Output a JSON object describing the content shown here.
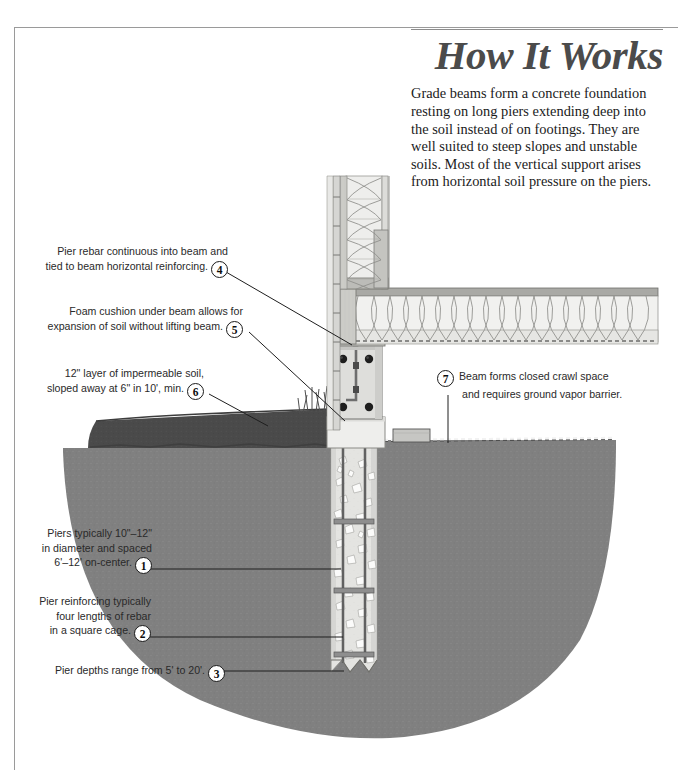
{
  "document": {
    "title": "How It Works",
    "intro": "Grade beams form a concrete foundation resting on long piers extending deep into the soil instead of on footings. They are well suited to steep slopes and unstable soils. Most of the vertical support arises from horizontal soil pressure on the piers.",
    "subject": "Grade beam and drilled pier foundation section"
  },
  "callouts": [
    {
      "number": "1",
      "lines": [
        "Piers typically 10\"–12\"",
        "in diameter and spaced",
        "6'–12' on-center."
      ],
      "side": "left"
    },
    {
      "number": "2",
      "lines": [
        "Pier reinforcing typically",
        "four lengths of rebar",
        "in a square cage."
      ],
      "side": "left"
    },
    {
      "number": "3",
      "lines": [
        "Pier depths range from 5' to 20'."
      ],
      "side": "left"
    },
    {
      "number": "4",
      "lines": [
        "Pier rebar continuous into beam and",
        "tied to beam horizontal reinforcing."
      ],
      "side": "left"
    },
    {
      "number": "5",
      "lines": [
        "Foam cushion under beam allows for",
        "expansion of soil without lifting beam."
      ],
      "side": "left"
    },
    {
      "number": "6",
      "lines": [
        "12\" layer of impermeable soil,",
        "sloped away at 6\" in 10', min."
      ],
      "side": "left"
    },
    {
      "number": "7",
      "lines": [
        "Beam forms closed crawl space",
        "and requires ground vapor barrier."
      ],
      "side": "right"
    }
  ],
  "drawing_elements": [
    {
      "name": "lap-siding",
      "label": "Lap siding"
    },
    {
      "name": "wall-sheathing",
      "label": "Wall sheathing"
    },
    {
      "name": "wall-batt-insulation",
      "label": "Wall batt insulation"
    },
    {
      "name": "rim-joist",
      "label": "Rim joist"
    },
    {
      "name": "floor-joist-insulation",
      "label": "Floor joist insulation"
    },
    {
      "name": "subfloor",
      "label": "Subfloor"
    },
    {
      "name": "grade-beam",
      "label": "Concrete grade beam"
    },
    {
      "name": "beam-horizontal-rebar",
      "label": "Beam horizontal rebar"
    },
    {
      "name": "pier-vertical-rebar",
      "label": "Pier vertical rebar"
    },
    {
      "name": "pier-rebar-tie",
      "label": "Pier rebar tie"
    },
    {
      "name": "foam-cushion",
      "label": "Foam cushion under beam"
    },
    {
      "name": "concrete-pier",
      "label": "Drilled concrete pier"
    },
    {
      "name": "impermeable-soil-layer",
      "label": "Impermeable soil layer"
    },
    {
      "name": "soil-mass",
      "label": "Undisturbed soil"
    },
    {
      "name": "grass",
      "label": "Grass at grade"
    },
    {
      "name": "vapor-barrier",
      "label": "Ground vapor barrier"
    },
    {
      "name": "crawl-space-block",
      "label": "Crawl space blocking"
    },
    {
      "name": "break-line",
      "label": "Pier break line"
    }
  ],
  "colors": {
    "frame": "#9a9a9a",
    "title": "#4b4b4b",
    "text": "#2a2a2a",
    "soil_mass": "#808080",
    "impermeable_soil": "#4a4a4a",
    "concrete": "#e2e2e0",
    "rebar": "#6e6e6e",
    "insulation": "#ececea",
    "framing": "#c9c9c6",
    "aggregate": "#fbfbfa"
  }
}
